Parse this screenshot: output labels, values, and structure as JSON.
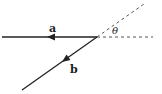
{
  "diagram": {
    "vectors": [
      {
        "name": "a",
        "label": "a",
        "direction": "left"
      },
      {
        "name": "b",
        "label": "b",
        "direction": "down-left"
      }
    ],
    "angle_label": "θ",
    "colors": {
      "line": "#222222",
      "dashed": "#555555"
    }
  }
}
